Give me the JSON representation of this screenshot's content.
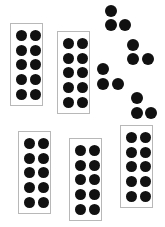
{
  "colors": {
    "dot": "#111111",
    "frame_border": "#b8b8b8",
    "background": "#ffffff"
  },
  "ten_frames": [
    {
      "id": "frame-1",
      "x": 10,
      "y": 23,
      "dots": 10
    },
    {
      "id": "frame-2",
      "x": 57,
      "y": 31,
      "dots": 10
    },
    {
      "id": "frame-3",
      "x": 18,
      "y": 131,
      "dots": 10
    },
    {
      "id": "frame-4",
      "x": 69,
      "y": 138,
      "dots": 10
    },
    {
      "id": "frame-5",
      "x": 120,
      "y": 125,
      "dots": 10
    }
  ],
  "loose_groups": [
    {
      "id": "group-a",
      "dots": [
        [
          111,
          11
        ],
        [
          111,
          25
        ],
        [
          125,
          25
        ]
      ]
    },
    {
      "id": "group-b",
      "dots": [
        [
          133,
          45
        ],
        [
          133,
          59
        ],
        [
          148,
          59
        ]
      ]
    },
    {
      "id": "group-c",
      "dots": [
        [
          103,
          69
        ],
        [
          103,
          84
        ],
        [
          118,
          84
        ]
      ]
    },
    {
      "id": "group-d",
      "dots": [
        [
          137,
          98
        ],
        [
          137,
          113
        ],
        [
          151,
          113
        ]
      ]
    }
  ],
  "totals": {
    "frames": 5,
    "dots_per_frame": 10,
    "loose_dots": 12,
    "total_dots": 62
  }
}
